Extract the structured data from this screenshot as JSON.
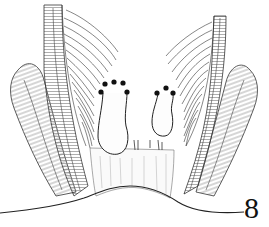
{
  "figure": {
    "label": "8",
    "ink_color": "#1a1a1a",
    "hatch_color": "#555555",
    "background": "#ffffff",
    "dots": {
      "left_group": [
        [
          101,
          92
        ],
        [
          105,
          84
        ],
        [
          114,
          82
        ],
        [
          123,
          83
        ],
        [
          127,
          92
        ]
      ],
      "right_group": [
        [
          157,
          93
        ],
        [
          166,
          88
        ],
        [
          173,
          93
        ]
      ],
      "color": "#111111",
      "radius": 2.6
    },
    "structures": [
      {
        "name": "left-outer-muscle-band"
      },
      {
        "name": "left-inner-sphincter-band"
      },
      {
        "name": "left-rectal-wall-striations"
      },
      {
        "name": "right-rectal-wall-striations"
      },
      {
        "name": "right-inner-sphincter-band"
      },
      {
        "name": "right-outer-muscle-band"
      },
      {
        "name": "left-hemorrhoid"
      },
      {
        "name": "right-hemorrhoid"
      },
      {
        "name": "anal-canal"
      },
      {
        "name": "skin-surface-line"
      }
    ]
  }
}
